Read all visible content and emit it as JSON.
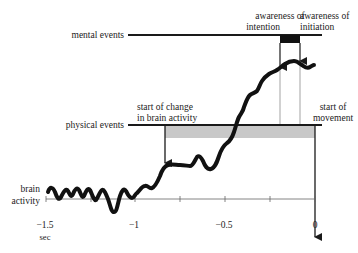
{
  "diagram": {
    "colors": {
      "line": "#1a1a1a",
      "trace": "#111111",
      "gray_band": "#c8c8c8",
      "black_box": "#111111",
      "thin_line": "#555555",
      "axis": "#555555",
      "text": "#222222"
    },
    "rows": {
      "mental_events": "mental events",
      "physical_events": "physical events"
    },
    "annotations": {
      "awareness_intention_line1": "awareness of",
      "awareness_intention_line2": "intention",
      "awareness_initiation_line1": "awareness of",
      "awareness_initiation_line2": "initiation",
      "start_change_line1": "start of change",
      "start_change_line2": "in brain activity",
      "start_movement_line1": "start of",
      "start_movement_line2": "movement"
    },
    "trace_label": {
      "line1": "brain",
      "line2": "activity"
    },
    "axis": {
      "ticks": [
        "−1.5",
        "−1",
        "−0.5",
        "0"
      ],
      "unit": "sec"
    }
  }
}
